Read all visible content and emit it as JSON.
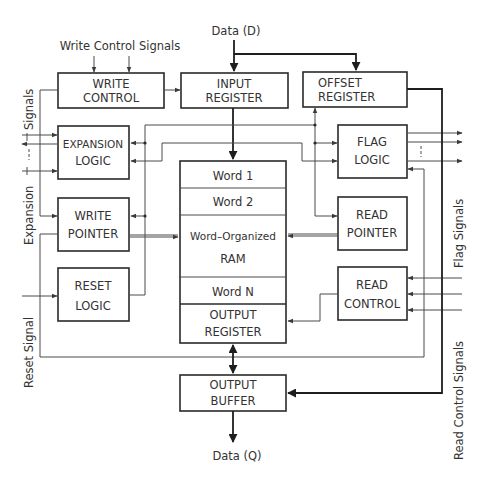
{
  "diagram": {
    "type": "block-diagram",
    "external_labels": {
      "data_in": "Data (D)",
      "data_out": "Data (Q)",
      "write_control_signals": "Write Control Signals",
      "expansion_signals": "Expansion | ---- | Signals",
      "expansion_signals_word1": "Expansion",
      "expansion_signals_dash": "----",
      "expansion_signals_word2": "Signals",
      "reset_signal": "Reset Signal",
      "flag_signals": "Flag Signals",
      "read_control_signals": "Read Control Signals"
    },
    "blocks": {
      "write_control": {
        "line1": "WRITE",
        "line2": "CONTROL"
      },
      "input_register": {
        "line1": "INPUT",
        "line2": "REGISTER"
      },
      "offset_register": {
        "line1": "OFFSET",
        "line2": "REGISTER"
      },
      "expansion_logic": {
        "line1": "EXPANSION",
        "line2": "LOGIC"
      },
      "flag_logic": {
        "line1": "FLAG",
        "line2": "LOGIC"
      },
      "write_pointer": {
        "line1": "WRITE",
        "line2": "POINTER"
      },
      "read_pointer": {
        "line1": "READ",
        "line2": "POINTER"
      },
      "reset_logic": {
        "line1": "RESET",
        "line2": "LOGIC"
      },
      "read_control": {
        "line1": "READ",
        "line2": "CONTROL"
      },
      "ram": {
        "word1": "Word 1",
        "word2": "Word 2",
        "title_line1": "Word–Organized",
        "title_line2": "RAM",
        "wordN": "Word N",
        "output_register_line1": "OUTPUT",
        "output_register_line2": "REGISTER"
      },
      "output_buffer": {
        "line1": "OUTPUT",
        "line2": "BUFFER"
      }
    },
    "connections": [
      {
        "from": "Data (D)",
        "to": "INPUT REGISTER"
      },
      {
        "from": "Data (D)",
        "to": "OFFSET REGISTER"
      },
      {
        "from": "Write Control Signals",
        "to": "WRITE CONTROL"
      },
      {
        "from": "WRITE CONTROL",
        "to": "INPUT REGISTER"
      },
      {
        "from": "WRITE CONTROL",
        "to": "WRITE POINTER"
      },
      {
        "from": "INPUT REGISTER",
        "to": "RAM"
      },
      {
        "from": "WRITE POINTER",
        "to": "RAM"
      },
      {
        "from": "READ POINTER",
        "to": "RAM"
      },
      {
        "from": "READ CONTROL",
        "to": "OUTPUT REGISTER"
      },
      {
        "from": "OUTPUT REGISTER",
        "to": "OUTPUT BUFFER",
        "bidirectional": true
      },
      {
        "from": "OUTPUT BUFFER",
        "to": "Data (Q)"
      },
      {
        "from": "OFFSET REGISTER",
        "to": "OUTPUT BUFFER"
      },
      {
        "from": "RESET LOGIC",
        "to": "EXPANSION LOGIC / WRITE POINTER / FLAG LOGIC / READ POINTER / OFFSET REGISTER"
      },
      {
        "from": "Expansion Signals",
        "to": "EXPANSION LOGIC",
        "bidirectional": true
      },
      {
        "from": "Reset Signal",
        "to": "RESET LOGIC"
      },
      {
        "from": "FLAG LOGIC",
        "to": "Flag Signals"
      },
      {
        "from": "Read Control Signals",
        "to": "READ CONTROL"
      },
      {
        "from": "WRITE POINTER",
        "to": "READ CONTROL (loop)"
      }
    ]
  }
}
